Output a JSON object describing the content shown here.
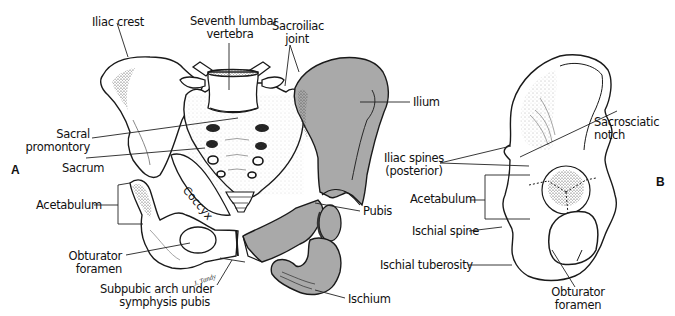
{
  "figure": {
    "panels": [
      {
        "id": "A",
        "label": "A",
        "view": "anterior articulated pelvis with exploded right os coxae"
      },
      {
        "id": "B",
        "label": "B",
        "view": "lateral view of os coxae"
      }
    ],
    "colors": {
      "bone_outline": "#1a1a1a",
      "bone_fill": "#ffffff",
      "highlight_bone_fill": "#a9a9a9",
      "stipple": "#555555",
      "leader_line": "#222222",
      "background": "#ffffff"
    },
    "signature": "J. Tandy",
    "coccyx_label": "Coccyx"
  },
  "labels_a": {
    "iliac_crest": "Iliac crest",
    "seventh_lumbar_1": "Seventh lumbar",
    "seventh_lumbar_2": "vertebra",
    "sacroiliac_1": "Sacroiliac",
    "sacroiliac_2": "joint",
    "ilium": "Ilium",
    "sacral_promontory_1": "Sacral",
    "sacral_promontory_2": "promontory",
    "sacrum": "Sacrum",
    "acetabulum": "Acetabulum",
    "obturator_1": "Obturator",
    "obturator_2": "foramen",
    "subpubic_1": "Subpubic arch under",
    "subpubic_2": "symphysis pubis",
    "pubis": "Pubis",
    "ischium": "Ischium"
  },
  "labels_b": {
    "iliac_spines_1": "Iliac spines",
    "iliac_spines_2": "(posterior)",
    "sacrosciatic_1": "Sacrosciatic",
    "sacrosciatic_2": "notch",
    "acetabulum": "Acetabulum",
    "ischial_spine": "Ischial spine",
    "ischial_tuberosity": "Ischial tuberosity",
    "obturator_1": "Obturator",
    "obturator_2": "foramen"
  }
}
